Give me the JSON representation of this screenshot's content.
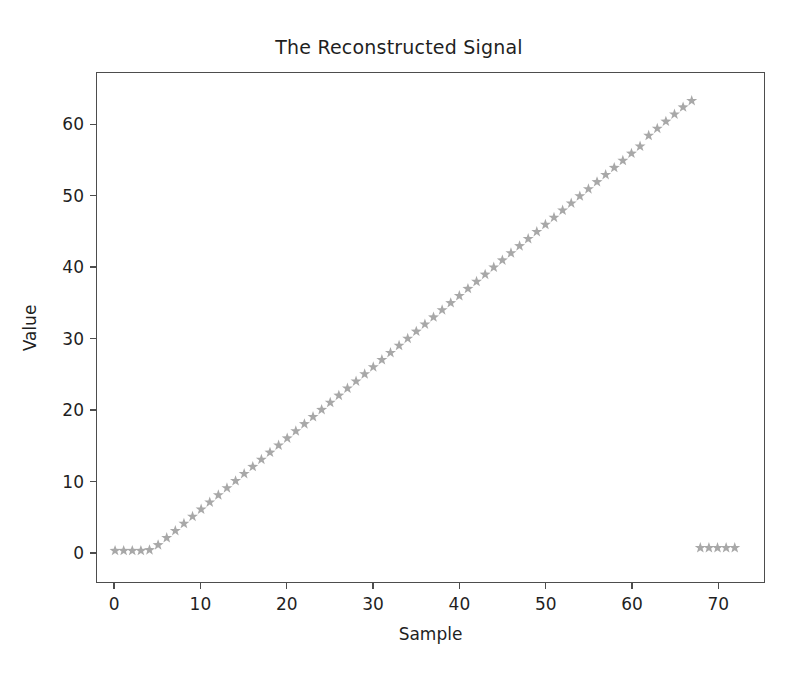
{
  "figure": {
    "background": "#ffffff",
    "width": 798,
    "height": 675
  },
  "chart_data": {
    "type": "scatter",
    "title": "The Reconstructed Signal",
    "xlabel": "Sample",
    "ylabel": "Value",
    "grid": false,
    "legend": null,
    "marker": {
      "style": "star",
      "color": "#a8a8a8",
      "size": 9
    },
    "xlim": [
      -2.1,
      75.4
    ],
    "ylim": [
      -4.2,
      67.3
    ],
    "xticks": [
      0,
      10,
      20,
      30,
      40,
      50,
      60,
      70
    ],
    "xtick_labels": [
      "0",
      "10",
      "20",
      "30",
      "40",
      "50",
      "60",
      "70"
    ],
    "yticks": [
      0,
      10,
      20,
      30,
      40,
      50,
      60
    ],
    "ytick_labels": [
      "0",
      "10",
      "20",
      "30",
      "40",
      "50",
      "60"
    ],
    "series": [
      {
        "name": "reconstructed signal",
        "x": [
          0,
          1,
          2,
          3,
          4,
          5,
          6,
          7,
          8,
          9,
          10,
          11,
          12,
          13,
          14,
          15,
          16,
          17,
          18,
          19,
          20,
          21,
          22,
          23,
          24,
          25,
          26,
          27,
          28,
          29,
          30,
          31,
          32,
          33,
          34,
          35,
          36,
          37,
          38,
          39,
          40,
          41,
          42,
          43,
          44,
          45,
          46,
          47,
          48,
          49,
          50,
          51,
          52,
          53,
          54,
          55,
          56,
          57,
          58,
          59,
          60,
          61,
          62,
          63,
          64,
          65,
          66,
          67,
          68,
          69,
          70,
          71,
          72
        ],
        "y": [
          0.2,
          0.2,
          0.2,
          0.2,
          0.3,
          1.0,
          2.0,
          3.0,
          4.0,
          5.0,
          6.0,
          7.0,
          8.0,
          9.0,
          10.0,
          11.0,
          12.0,
          13.0,
          14.0,
          15.0,
          16.0,
          17.0,
          18.0,
          19.0,
          20.0,
          21.0,
          22.0,
          23.0,
          24.0,
          25.0,
          26.0,
          27.0,
          28.0,
          29.0,
          30.0,
          31.0,
          32.0,
          33.0,
          34.0,
          35.0,
          36.0,
          37.0,
          38.0,
          39.0,
          40.0,
          41.0,
          42.0,
          43.0,
          44.0,
          45.0,
          46.0,
          47.0,
          48.0,
          49.0,
          50.0,
          51.0,
          52.0,
          53.0,
          54.0,
          55.0,
          56.0,
          57.0,
          58.5,
          59.5,
          60.5,
          61.5,
          62.5,
          63.4,
          0.6,
          0.6,
          0.6,
          0.6,
          0.6
        ]
      }
    ],
    "annotations": [
      "flat segment at value 0 for samples 0-4",
      "linear ramp of slope about 1.0 per sample from sample 5 to sample 67",
      "detached low cluster of 5 markers near value 0.6 for samples 68-72"
    ]
  }
}
